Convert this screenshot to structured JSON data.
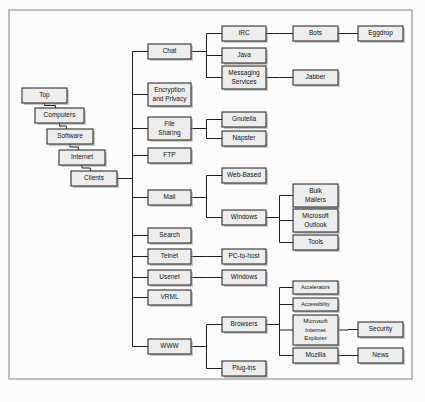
{
  "diagram": {
    "type": "hierarchical-tree",
    "orientation": "left-to-right",
    "canvas": {
      "width": 425,
      "height": 402
    },
    "frame": {
      "x": 9,
      "y": 10,
      "width": 403,
      "height": 369
    },
    "style": {
      "box_fill": "#ededed",
      "box_stroke": "#1d1d1d",
      "line_color": "#1d1d1d",
      "page_background": "#fbfbfb",
      "frame_stroke": "#8d8d8d",
      "text_color": "#111111"
    },
    "nodes": [
      {
        "id": "top",
        "label": "Top",
        "lines": [
          "Top"
        ],
        "x": 22,
        "y": 88,
        "w": 45,
        "h": 15,
        "font": 6.5
      },
      {
        "id": "computers",
        "label": "Computers",
        "lines": [
          "Computers"
        ],
        "x": 35,
        "y": 108,
        "w": 49,
        "h": 15,
        "font": 6.5
      },
      {
        "id": "software",
        "label": "Software",
        "lines": [
          "Software"
        ],
        "x": 47,
        "y": 129,
        "w": 46,
        "h": 15,
        "font": 6.5
      },
      {
        "id": "internet",
        "label": "Internet",
        "lines": [
          "Internet"
        ],
        "x": 59,
        "y": 150,
        "w": 46,
        "h": 15,
        "font": 6.5
      },
      {
        "id": "clients",
        "label": "Clients",
        "lines": [
          "Clients"
        ],
        "x": 71,
        "y": 171,
        "w": 46,
        "h": 15,
        "font": 6.5
      },
      {
        "id": "chat",
        "label": "Chat",
        "lines": [
          "Chat"
        ],
        "x": 148,
        "y": 44,
        "w": 43,
        "h": 15,
        "font": 6.5
      },
      {
        "id": "encryption",
        "label": "Encryption and Privacy",
        "lines": [
          "Encryption",
          "and Privacy"
        ],
        "x": 148,
        "y": 83,
        "w": 43,
        "h": 23,
        "font": 6.5
      },
      {
        "id": "filesharing",
        "label": "File Sharing",
        "lines": [
          "File",
          "Sharing"
        ],
        "x": 148,
        "y": 117,
        "w": 43,
        "h": 23,
        "font": 6.5
      },
      {
        "id": "ftp",
        "label": "FTP",
        "lines": [
          "FTP"
        ],
        "x": 148,
        "y": 148,
        "w": 43,
        "h": 15,
        "font": 6.5
      },
      {
        "id": "mail",
        "label": "Mail",
        "lines": [
          "Mail"
        ],
        "x": 148,
        "y": 190,
        "w": 43,
        "h": 15,
        "font": 6.5
      },
      {
        "id": "search",
        "label": "Search",
        "lines": [
          "Search"
        ],
        "x": 148,
        "y": 228,
        "w": 43,
        "h": 15,
        "font": 6.5
      },
      {
        "id": "telnet",
        "label": "Telnet",
        "lines": [
          "Telnet"
        ],
        "x": 148,
        "y": 249,
        "w": 43,
        "h": 15,
        "font": 6.5
      },
      {
        "id": "usenet",
        "label": "Usenet",
        "lines": [
          "Usenet"
        ],
        "x": 148,
        "y": 270,
        "w": 43,
        "h": 15,
        "font": 6.5
      },
      {
        "id": "vrml",
        "label": "VRML",
        "lines": [
          "VRML"
        ],
        "x": 148,
        "y": 290,
        "w": 43,
        "h": 15,
        "font": 6.5
      },
      {
        "id": "www",
        "label": "WWW",
        "lines": [
          "WWW"
        ],
        "x": 148,
        "y": 339,
        "w": 43,
        "h": 15,
        "font": 6.5
      },
      {
        "id": "irc",
        "label": "IRC",
        "lines": [
          "IRC"
        ],
        "x": 222,
        "y": 26,
        "w": 44,
        "h": 15,
        "font": 6.5
      },
      {
        "id": "java",
        "label": "Java",
        "lines": [
          "Java"
        ],
        "x": 222,
        "y": 48,
        "w": 44,
        "h": 15,
        "font": 6.5
      },
      {
        "id": "messaging",
        "label": "Messaging Services",
        "lines": [
          "Messaging",
          "Services"
        ],
        "x": 222,
        "y": 66,
        "w": 44,
        "h": 23,
        "font": 6.5
      },
      {
        "id": "gnutella",
        "label": "Gnutella",
        "lines": [
          "Gnutella"
        ],
        "x": 222,
        "y": 112,
        "w": 44,
        "h": 15,
        "font": 6.5
      },
      {
        "id": "napster",
        "label": "Napster",
        "lines": [
          "Napster"
        ],
        "x": 222,
        "y": 131,
        "w": 44,
        "h": 15,
        "font": 6.5
      },
      {
        "id": "webbased",
        "label": "Web-Based",
        "lines": [
          "Web-Based"
        ],
        "x": 222,
        "y": 168,
        "w": 44,
        "h": 15,
        "font": 6.5
      },
      {
        "id": "mailwindows",
        "label": "Windows",
        "lines": [
          "Windows"
        ],
        "x": 222,
        "y": 210,
        "w": 44,
        "h": 15,
        "font": 6.5
      },
      {
        "id": "pctohost",
        "label": "PC-to-host",
        "lines": [
          "PC-to-host"
        ],
        "x": 222,
        "y": 249,
        "w": 44,
        "h": 15,
        "font": 6.5
      },
      {
        "id": "usenetwin",
        "label": "Windows",
        "lines": [
          "Windows"
        ],
        "x": 222,
        "y": 270,
        "w": 44,
        "h": 15,
        "font": 6.5
      },
      {
        "id": "browsers",
        "label": "Browsers",
        "lines": [
          "Browsers"
        ],
        "x": 222,
        "y": 317,
        "w": 44,
        "h": 15,
        "font": 6.5
      },
      {
        "id": "plugins",
        "label": "Plug-ins",
        "lines": [
          "Plug-ins"
        ],
        "x": 222,
        "y": 361,
        "w": 44,
        "h": 15,
        "font": 6.5
      },
      {
        "id": "bots",
        "label": "Bots",
        "lines": [
          "Bots"
        ],
        "x": 293,
        "y": 26,
        "w": 45,
        "h": 15,
        "font": 6.5
      },
      {
        "id": "jabber",
        "label": "Jabber",
        "lines": [
          "Jabber"
        ],
        "x": 293,
        "y": 70,
        "w": 45,
        "h": 15,
        "font": 6.5
      },
      {
        "id": "bulkmailers",
        "label": "Bulk Mailers",
        "lines": [
          "Bulk",
          "Mailers"
        ],
        "x": 293,
        "y": 184,
        "w": 45,
        "h": 23,
        "font": 6.5
      },
      {
        "id": "outlook",
        "label": "Microsoft Outlook",
        "lines": [
          "Microsoft",
          "Outlook"
        ],
        "x": 293,
        "y": 209,
        "w": 45,
        "h": 23,
        "font": 6.5
      },
      {
        "id": "tools",
        "label": "Tools",
        "lines": [
          "Tools"
        ],
        "x": 293,
        "y": 235,
        "w": 45,
        "h": 15,
        "font": 6.5
      },
      {
        "id": "accelerators",
        "label": "Accelerators",
        "lines": [
          "Accelerators"
        ],
        "x": 293,
        "y": 281,
        "w": 45,
        "h": 13,
        "font": 5.2
      },
      {
        "id": "accessibility",
        "label": "Accessibility",
        "lines": [
          "Accessibility"
        ],
        "x": 293,
        "y": 298,
        "w": 45,
        "h": 13,
        "font": 5.2
      },
      {
        "id": "msie",
        "label": "Microsoft Internet Explorer",
        "lines": [
          "Microsoft",
          "Internet",
          "Explorer"
        ],
        "x": 293,
        "y": 315,
        "w": 45,
        "h": 30,
        "font": 6.0
      },
      {
        "id": "mozilla",
        "label": "Mozilla",
        "lines": [
          "Mozilla"
        ],
        "x": 293,
        "y": 348,
        "w": 45,
        "h": 15,
        "font": 6.5
      },
      {
        "id": "eggdrop",
        "label": "Eggdrop",
        "lines": [
          "Eggdrop"
        ],
        "x": 358,
        "y": 26,
        "w": 45,
        "h": 15,
        "font": 6.5
      },
      {
        "id": "security",
        "label": "Security",
        "lines": [
          "Security"
        ],
        "x": 358,
        "y": 322,
        "w": 45,
        "h": 15,
        "font": 6.5
      },
      {
        "id": "news",
        "label": "News",
        "lines": [
          "News"
        ],
        "x": 358,
        "y": 348,
        "w": 45,
        "h": 15,
        "font": 6.5
      }
    ],
    "edges": [
      {
        "from": "top",
        "to": "computers",
        "style": "elbow-down"
      },
      {
        "from": "computers",
        "to": "software",
        "style": "elbow-down"
      },
      {
        "from": "software",
        "to": "internet",
        "style": "elbow-down"
      },
      {
        "from": "internet",
        "to": "clients",
        "style": "elbow-down"
      },
      {
        "from": "clients",
        "to": "chat",
        "style": "elbow-right"
      },
      {
        "from": "clients",
        "to": "encryption",
        "style": "elbow-right"
      },
      {
        "from": "clients",
        "to": "filesharing",
        "style": "elbow-right"
      },
      {
        "from": "clients",
        "to": "ftp",
        "style": "elbow-right"
      },
      {
        "from": "clients",
        "to": "mail",
        "style": "elbow-right"
      },
      {
        "from": "clients",
        "to": "search",
        "style": "elbow-right"
      },
      {
        "from": "clients",
        "to": "telnet",
        "style": "elbow-right"
      },
      {
        "from": "clients",
        "to": "usenet",
        "style": "elbow-right"
      },
      {
        "from": "clients",
        "to": "vrml",
        "style": "elbow-right"
      },
      {
        "from": "clients",
        "to": "www",
        "style": "elbow-right"
      },
      {
        "from": "chat",
        "to": "irc",
        "style": "elbow-right"
      },
      {
        "from": "chat",
        "to": "java",
        "style": "elbow-right"
      },
      {
        "from": "chat",
        "to": "messaging",
        "style": "elbow-right"
      },
      {
        "from": "filesharing",
        "to": "gnutella",
        "style": "elbow-right"
      },
      {
        "from": "filesharing",
        "to": "napster",
        "style": "elbow-right"
      },
      {
        "from": "mail",
        "to": "webbased",
        "style": "elbow-right"
      },
      {
        "from": "mail",
        "to": "mailwindows",
        "style": "elbow-right"
      },
      {
        "from": "telnet",
        "to": "pctohost",
        "style": "elbow-right"
      },
      {
        "from": "usenet",
        "to": "usenetwin",
        "style": "elbow-right"
      },
      {
        "from": "www",
        "to": "browsers",
        "style": "elbow-right"
      },
      {
        "from": "www",
        "to": "plugins",
        "style": "elbow-right"
      },
      {
        "from": "irc",
        "to": "bots",
        "style": "elbow-right"
      },
      {
        "from": "messaging",
        "to": "jabber",
        "style": "elbow-right"
      },
      {
        "from": "mailwindows",
        "to": "bulkmailers",
        "style": "elbow-right"
      },
      {
        "from": "mailwindows",
        "to": "outlook",
        "style": "elbow-right"
      },
      {
        "from": "mailwindows",
        "to": "tools",
        "style": "elbow-right"
      },
      {
        "from": "browsers",
        "to": "accelerators",
        "style": "elbow-right"
      },
      {
        "from": "browsers",
        "to": "accessibility",
        "style": "elbow-right"
      },
      {
        "from": "browsers",
        "to": "msie",
        "style": "elbow-right"
      },
      {
        "from": "browsers",
        "to": "mozilla",
        "style": "elbow-right"
      },
      {
        "from": "bots",
        "to": "eggdrop",
        "style": "elbow-right"
      },
      {
        "from": "msie",
        "to": "security",
        "style": "elbow-right"
      },
      {
        "from": "mozilla",
        "to": "news",
        "style": "elbow-right"
      }
    ]
  }
}
